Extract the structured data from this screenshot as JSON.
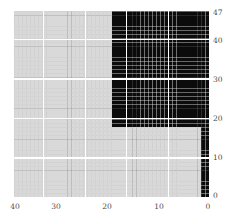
{
  "figure": {
    "title": "",
    "background_color": "#ffffff"
  },
  "axes": {
    "x": {
      "label": "",
      "position": "bottom",
      "direction": "reversed",
      "range": [
        47,
        0
      ],
      "tick_labels": [
        "40",
        "30",
        "20",
        "10",
        "0"
      ],
      "tick_values": [
        40,
        30,
        20,
        10,
        0
      ],
      "tick_pixels": [
        15,
        56,
        107,
        159,
        208
      ]
    },
    "y": {
      "label": "",
      "position": "right",
      "direction": "reversed",
      "range": [
        47,
        0
      ],
      "tick_labels": [
        "47",
        "40",
        "30",
        "20",
        "10",
        "0"
      ],
      "tick_values": [
        47,
        40,
        30,
        20,
        10,
        0
      ],
      "tick_pixels": [
        13,
        41,
        80,
        119,
        158,
        196
      ]
    }
  },
  "gridlines": {
    "major_color": "#ffffff",
    "minor_color_light_region": "#a0a0a0",
    "minor_color_dark_region": "#2a2a2a",
    "major_spacing_units": 10,
    "vertical_major_units": [
      40,
      30,
      20,
      10
    ],
    "horizontal_major_units": [
      40,
      30,
      20,
      10
    ]
  },
  "colors": {
    "light_cell": "#d9d9d9",
    "dark_cell": "#0b0b0b",
    "text": "#4a4a4a",
    "page_background": "#ffffff"
  },
  "chart_data": {
    "type": "heatmap",
    "title": "",
    "xlabel": "",
    "ylabel": "",
    "n_rows": 48,
    "n_cols": 48,
    "x": [
      47,
      46,
      45,
      44,
      43,
      42,
      41,
      40,
      39,
      38,
      37,
      36,
      35,
      34,
      33,
      32,
      31,
      30,
      29,
      28,
      27,
      26,
      25,
      24,
      23,
      22,
      21,
      20,
      19,
      18,
      17,
      16,
      15,
      14,
      13,
      12,
      11,
      10,
      9,
      8,
      7,
      6,
      5,
      4,
      3,
      2,
      1,
      0
    ],
    "y": [
      47,
      46,
      45,
      44,
      43,
      42,
      41,
      40,
      39,
      38,
      37,
      36,
      35,
      34,
      33,
      32,
      31,
      30,
      29,
      28,
      27,
      26,
      25,
      24,
      23,
      22,
      21,
      20,
      19,
      18,
      17,
      16,
      15,
      14,
      13,
      12,
      11,
      10,
      9,
      8,
      7,
      6,
      5,
      4,
      3,
      2,
      1,
      0
    ],
    "xlim": [
      47,
      0
    ],
    "ylim": [
      47,
      0
    ],
    "grid": true,
    "legend": "none",
    "value_levels": [
      0,
      1
    ],
    "level_colors": [
      "#d9d9d9",
      "#0b0b0b"
    ],
    "dark_block_primary": {
      "col_range_units": [
        23,
        0
      ],
      "row_range_units": [
        47,
        18
      ],
      "col_index_range": [
        24,
        47
      ],
      "row_index_range": [
        0,
        29
      ]
    },
    "dark_block_secondary": {
      "col_range_units": [
        1,
        0
      ],
      "row_range_units": [
        17,
        0
      ],
      "col_index_range": [
        46,
        47
      ],
      "row_index_range": [
        30,
        47
      ]
    },
    "matrix_rule": "cell(row_idx, col_idx) = 1 if (col_idx >= 24 and row_idx <= 29) or (col_idx >= 46) else 0"
  }
}
